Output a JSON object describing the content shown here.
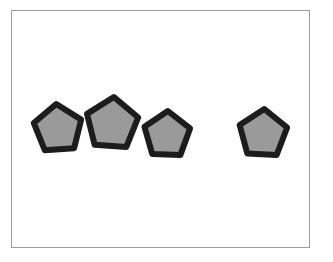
{
  "scene": {
    "title": "Four gray pentagons in a white frame",
    "canvas_width": 333,
    "canvas_height": 262,
    "background_color": "#ffffff"
  },
  "frame": {
    "label": "picture-frame",
    "left": 11,
    "top": 10,
    "width": 299,
    "height": 238,
    "border_color": "#9b9b9b",
    "border_width": 1,
    "fill_color": "#ffffff"
  },
  "style": {
    "shape_fill": "#9a9a9a",
    "shape_stroke": "#1c1c1c"
  },
  "shapes": [
    {
      "id": "pentagon-1",
      "name": "pentagon",
      "label": "Pentagon 1",
      "fill": "#9a9a9a",
      "stroke": "#1c1c1c",
      "stroke_width": 6,
      "center_x": 58,
      "center_y": 129,
      "radius": 25,
      "rotation": -4
    },
    {
      "id": "pentagon-2",
      "name": "pentagon",
      "label": "Pentagon 2",
      "fill": "#9a9a9a",
      "stroke": "#1c1c1c",
      "stroke_width": 6,
      "center_x": 112,
      "center_y": 124,
      "radius": 27,
      "rotation": 4
    },
    {
      "id": "pentagon-3",
      "name": "pentagon",
      "label": "Pentagon 3",
      "fill": "#9a9a9a",
      "stroke": "#1c1c1c",
      "stroke_width": 6,
      "center_x": 167,
      "center_y": 135,
      "radius": 24,
      "rotation": 2
    },
    {
      "id": "pentagon-4",
      "name": "pentagon",
      "label": "Pentagon 4",
      "fill": "#9a9a9a",
      "stroke": "#1c1c1c",
      "stroke_width": 6,
      "center_x": 263,
      "center_y": 134,
      "radius": 25,
      "rotation": 3
    }
  ]
}
